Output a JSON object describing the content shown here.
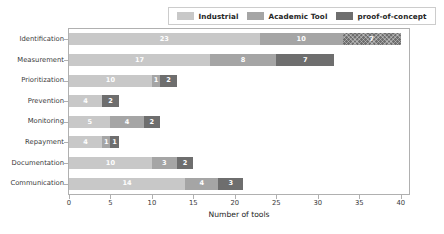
{
  "chart_data": {
    "type": "bar",
    "orientation": "horizontal",
    "stacked": true,
    "title": "",
    "xlabel": "Number of tools",
    "ylabel": "",
    "xlim": [
      0,
      41
    ],
    "ylim": [
      0,
      8
    ],
    "grid": false,
    "legend_position": "upper center",
    "xticks": [
      0,
      5,
      10,
      15,
      20,
      25,
      30,
      35,
      40
    ],
    "xtick_labels": [
      "0",
      "5",
      "10",
      "15",
      "20",
      "25",
      "30",
      "35",
      "40"
    ],
    "categories": [
      "Identification",
      "Measurement",
      "Prioritization",
      "Prevention",
      "Monitoring",
      "Repayment",
      "Documentation",
      "Communication"
    ],
    "series": [
      {
        "name": "Industrial",
        "color": "#c8c8c8",
        "values": [
          23,
          17,
          10,
          4,
          5,
          4,
          10,
          14
        ],
        "labels": [
          "23",
          "17",
          "10",
          "4",
          "5",
          "4",
          "10",
          "14"
        ]
      },
      {
        "name": "Academic Tool",
        "color": "#a5a5a5",
        "values": [
          10,
          8,
          1,
          0,
          4,
          1,
          3,
          4
        ],
        "labels": [
          "10",
          "8",
          "1",
          "",
          "4",
          "1",
          "3",
          "4"
        ]
      },
      {
        "name": "proof-of-concept",
        "color": "#6e6e6e",
        "values": [
          7,
          7,
          2,
          2,
          2,
          1,
          2,
          3
        ],
        "labels": [
          "7",
          "7",
          "2",
          "2",
          "2",
          "1",
          "2",
          "3"
        ]
      }
    ],
    "totals": [
      40,
      32,
      13,
      6,
      11,
      6,
      15,
      21
    ],
    "hatched_segments": [
      {
        "row": 0,
        "series": 2
      }
    ]
  },
  "legend": {
    "entries": [
      {
        "label": "Industrial",
        "color": "#c8c8c8"
      },
      {
        "label": "Academic Tool",
        "color": "#a5a5a5"
      },
      {
        "label": "proof-of-concept",
        "color": "#6e6e6e"
      }
    ]
  },
  "axis": {
    "x_title": "Number of tools"
  }
}
